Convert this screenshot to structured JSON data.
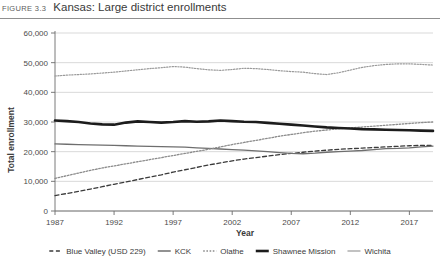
{
  "figure": {
    "number": "FIGURE 3.3",
    "title": "Kansas: Large district enrollments"
  },
  "chart_data": {
    "type": "line",
    "title": "Kansas: Large district enrollments",
    "xlabel": "Year",
    "ylabel": "Total enrollment",
    "xlim": [
      1987,
      2019
    ],
    "ylim": [
      0,
      60000
    ],
    "xticks": [
      1987,
      1992,
      1997,
      2002,
      2007,
      2012,
      2017
    ],
    "xtick_labels": [
      "1987",
      "1992",
      "1997",
      "2002",
      "2007",
      "2012",
      "2017"
    ],
    "yticks": [
      0,
      10000,
      20000,
      30000,
      40000,
      50000,
      60000
    ],
    "ytick_labels": [
      "0",
      "10,000",
      "20,000",
      "30,000",
      "40,000",
      "50,000",
      "60,000"
    ],
    "grid": true,
    "legend_position": "bottom",
    "x": [
      1987,
      1988,
      1989,
      1990,
      1991,
      1992,
      1993,
      1994,
      1995,
      1996,
      1997,
      1998,
      1999,
      2000,
      2001,
      2002,
      2003,
      2004,
      2005,
      2006,
      2007,
      2008,
      2009,
      2010,
      2011,
      2012,
      2013,
      2014,
      2015,
      2016,
      2017,
      2018,
      2019
    ],
    "series": [
      {
        "name": "Blue Valley (USD 229)",
        "style": "dashed",
        "color": "#3b3b3b",
        "width": 1.3,
        "values": [
          5200,
          5900,
          6600,
          7400,
          8200,
          9000,
          9800,
          10600,
          11400,
          12200,
          13100,
          13900,
          14700,
          15500,
          16200,
          16900,
          17500,
          18000,
          18500,
          19000,
          19400,
          19800,
          20200,
          20500,
          20800,
          21000,
          21200,
          21400,
          21600,
          21800,
          22000,
          22100,
          22100
        ]
      },
      {
        "name": "KCK",
        "style": "solid",
        "color": "#6e6e6e",
        "width": 1.3,
        "values": [
          22600,
          22500,
          22400,
          22300,
          22200,
          22100,
          22000,
          21900,
          21800,
          21700,
          21600,
          21500,
          21300,
          21100,
          20900,
          20700,
          20500,
          20300,
          20000,
          19700,
          19400,
          19300,
          19500,
          19800,
          20000,
          20200,
          20400,
          20700,
          21000,
          21100,
          21300,
          21600,
          21900
        ]
      },
      {
        "name": "Olathe",
        "style": "dotted",
        "color": "#8c8c8c",
        "width": 1.3,
        "values": [
          11000,
          11900,
          12800,
          13700,
          14500,
          15200,
          15900,
          16600,
          17300,
          18000,
          18700,
          19400,
          20100,
          20800,
          21600,
          22400,
          23100,
          23800,
          24500,
          25200,
          25800,
          26400,
          26900,
          27300,
          27700,
          28000,
          28300,
          28600,
          28900,
          29200,
          29500,
          29800,
          30000
        ]
      },
      {
        "name": "Shawnee Mission",
        "style": "solid",
        "color": "#1c1c1c",
        "width": 2.6,
        "values": [
          30500,
          30300,
          30000,
          29500,
          29200,
          29100,
          29800,
          30200,
          30000,
          29800,
          30000,
          30300,
          30100,
          30200,
          30500,
          30300,
          30100,
          30000,
          29700,
          29400,
          29100,
          28800,
          28500,
          28200,
          28000,
          27800,
          27600,
          27500,
          27400,
          27300,
          27200,
          27100,
          27000
        ]
      },
      {
        "name": "Wichita",
        "style": "dotted-fine",
        "color": "#9a9a9a",
        "width": 1.2,
        "values": [
          45500,
          45800,
          46000,
          46200,
          46500,
          46800,
          47200,
          47600,
          48000,
          48300,
          48700,
          48500,
          48000,
          47600,
          47400,
          47700,
          48100,
          48000,
          47700,
          47300,
          47000,
          46800,
          46300,
          46000,
          46600,
          47500,
          48400,
          49000,
          49400,
          49600,
          49600,
          49400,
          49200
        ]
      }
    ]
  },
  "legend": {
    "items": [
      {
        "label": "Blue Valley (USD 229)",
        "style": "dashed"
      },
      {
        "label": "KCK",
        "style": "solid"
      },
      {
        "label": "Olathe",
        "style": "dotted"
      },
      {
        "label": "Shawnee Mission",
        "style": "thick"
      },
      {
        "label": "Wichita",
        "style": "thin"
      }
    ]
  }
}
